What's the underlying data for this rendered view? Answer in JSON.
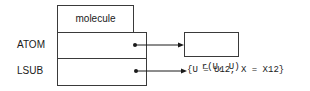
{
  "diagram": {
    "header": "molecule",
    "rows": [
      {
        "label": "ATOM",
        "target": "r(U, U)",
        "target_boxed": true
      },
      {
        "label": "LSUB",
        "target": "{U = U12, X = X12}",
        "target_boxed": false
      }
    ],
    "colors": {
      "line": "#1a1a1a",
      "background": "#ffffff"
    }
  }
}
